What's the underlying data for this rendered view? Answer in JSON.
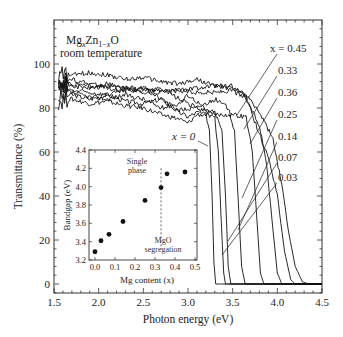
{
  "chart_data": [
    {
      "type": "line",
      "title": "",
      "annotation_title": [
        "MgxZn1-xO",
        "room temperature"
      ],
      "xlabel": "Photon energy (eV)",
      "ylabel": "Transmittance (%)",
      "xlim": [
        1.5,
        4.5
      ],
      "ylim": [
        -5,
        118
      ],
      "xticks": [
        1.5,
        2.0,
        2.5,
        3.0,
        3.5,
        4.0,
        4.5
      ],
      "xtick_labels": [
        "1.5",
        "2.0",
        "2.5",
        "3.0",
        "3.5",
        "4.0",
        "4.5"
      ],
      "yticks": [
        0,
        20,
        40,
        60,
        80,
        100
      ],
      "ytick_labels": [
        "0",
        "20",
        "40",
        "60",
        "80",
        "100"
      ],
      "grid": false,
      "legend": "inline labels on right with leader lines",
      "series": [
        {
          "name": "x = 0",
          "label": "x = 0",
          "edge_eV": 3.27,
          "points": [
            [
              1.55,
              85
            ],
            [
              1.7,
              86
            ],
            [
              1.9,
              84
            ],
            [
              2.1,
              86
            ],
            [
              2.3,
              83
            ],
            [
              2.5,
              82
            ],
            [
              2.7,
              84
            ],
            [
              2.9,
              78
            ],
            [
              3.0,
              76
            ],
            [
              3.1,
              78
            ],
            [
              3.2,
              77
            ],
            [
              3.24,
              70
            ],
            [
              3.27,
              40
            ],
            [
              3.29,
              10
            ],
            [
              3.31,
              0
            ],
            [
              4.5,
              0
            ]
          ]
        },
        {
          "name": "x = 0.03",
          "label": "0.03",
          "edge_eV": 3.37,
          "points": [
            [
              1.55,
              83
            ],
            [
              1.7,
              84
            ],
            [
              1.9,
              82
            ],
            [
              2.1,
              83
            ],
            [
              2.3,
              81
            ],
            [
              2.5,
              80
            ],
            [
              2.7,
              77
            ],
            [
              2.9,
              75
            ],
            [
              3.0,
              73
            ],
            [
              3.1,
              77
            ],
            [
              3.2,
              77
            ],
            [
              3.3,
              75
            ],
            [
              3.34,
              60
            ],
            [
              3.37,
              30
            ],
            [
              3.4,
              5
            ],
            [
              3.42,
              0
            ],
            [
              4.5,
              0
            ]
          ]
        },
        {
          "name": "x = 0.07",
          "label": "0.07",
          "edge_eV": 3.42,
          "points": [
            [
              1.55,
              88
            ],
            [
              1.7,
              87
            ],
            [
              1.9,
              85
            ],
            [
              2.1,
              84
            ],
            [
              2.3,
              86
            ],
            [
              2.5,
              84
            ],
            [
              2.7,
              80
            ],
            [
              2.9,
              82
            ],
            [
              3.0,
              86
            ],
            [
              3.1,
              83
            ],
            [
              3.2,
              79
            ],
            [
              3.3,
              78
            ],
            [
              3.38,
              70
            ],
            [
              3.42,
              40
            ],
            [
              3.45,
              8
            ],
            [
              3.48,
              0
            ],
            [
              4.5,
              0
            ]
          ]
        },
        {
          "name": "x = 0.14",
          "label": "0.14",
          "edge_eV": 3.56,
          "points": [
            [
              1.55,
              90
            ],
            [
              1.7,
              88
            ],
            [
              1.9,
              87
            ],
            [
              2.1,
              86
            ],
            [
              2.3,
              88
            ],
            [
              2.5,
              89
            ],
            [
              2.7,
              84
            ],
            [
              2.9,
              79
            ],
            [
              3.1,
              80
            ],
            [
              3.3,
              84
            ],
            [
              3.45,
              80
            ],
            [
              3.52,
              70
            ],
            [
              3.56,
              40
            ],
            [
              3.6,
              8
            ],
            [
              3.64,
              0
            ],
            [
              4.5,
              0
            ]
          ]
        },
        {
          "name": "x = 0.25",
          "label": "0.25",
          "edge_eV": 3.77,
          "points": [
            [
              1.55,
              92
            ],
            [
              1.7,
              90
            ],
            [
              1.9,
              89
            ],
            [
              2.1,
              91
            ],
            [
              2.3,
              89
            ],
            [
              2.5,
              87
            ],
            [
              2.7,
              89
            ],
            [
              2.9,
              84
            ],
            [
              3.1,
              80
            ],
            [
              3.3,
              77
            ],
            [
              3.5,
              77
            ],
            [
              3.65,
              76
            ],
            [
              3.72,
              60
            ],
            [
              3.77,
              30
            ],
            [
              3.81,
              5
            ],
            [
              3.85,
              0
            ],
            [
              4.5,
              0
            ]
          ]
        },
        {
          "name": "x = 0.36",
          "label": "0.36",
          "edge_eV": 3.97,
          "points": [
            [
              1.55,
              90
            ],
            [
              1.7,
              91
            ],
            [
              1.9,
              90
            ],
            [
              2.1,
              89
            ],
            [
              2.3,
              88
            ],
            [
              2.5,
              88
            ],
            [
              2.7,
              87
            ],
            [
              2.9,
              88
            ],
            [
              3.1,
              87
            ],
            [
              3.3,
              87
            ],
            [
              3.5,
              88
            ],
            [
              3.65,
              84
            ],
            [
              3.8,
              72
            ],
            [
              3.88,
              55
            ],
            [
              3.95,
              25
            ],
            [
              4.0,
              5
            ],
            [
              4.05,
              0
            ],
            [
              4.5,
              0
            ]
          ]
        },
        {
          "name": "x = 0.33",
          "label": "0.33",
          "edge_eV": 4.07,
          "points": [
            [
              1.55,
              92
            ],
            [
              1.7,
              93
            ],
            [
              1.9,
              91
            ],
            [
              2.1,
              90
            ],
            [
              2.3,
              89
            ],
            [
              2.5,
              89
            ],
            [
              2.7,
              88
            ],
            [
              2.9,
              88
            ],
            [
              3.1,
              89
            ],
            [
              3.3,
              90
            ],
            [
              3.5,
              90
            ],
            [
              3.65,
              85
            ],
            [
              3.8,
              68
            ],
            [
              3.9,
              58
            ],
            [
              4.0,
              40
            ],
            [
              4.08,
              15
            ],
            [
              4.15,
              2
            ],
            [
              4.2,
              0
            ],
            [
              4.5,
              0
            ]
          ]
        },
        {
          "name": "x = 0.45",
          "label": "x = 0.45",
          "edge_eV": 4.17,
          "points": [
            [
              1.55,
              95
            ],
            [
              1.7,
              95
            ],
            [
              1.9,
              96
            ],
            [
              2.1,
              95
            ],
            [
              2.3,
              93
            ],
            [
              2.5,
              94
            ],
            [
              2.7,
              92
            ],
            [
              2.9,
              91
            ],
            [
              3.1,
              93
            ],
            [
              3.3,
              90
            ],
            [
              3.5,
              89
            ],
            [
              3.65,
              86
            ],
            [
              3.8,
              78
            ],
            [
              3.95,
              66
            ],
            [
              4.05,
              45
            ],
            [
              4.12,
              25
            ],
            [
              4.2,
              8
            ],
            [
              4.28,
              1
            ],
            [
              4.35,
              0
            ],
            [
              4.5,
              0
            ]
          ]
        }
      ],
      "right_labels": [
        "x = 0.45",
        "0.33",
        "0.36",
        "0.25",
        "0.14",
        "0.07",
        "0.03"
      ],
      "inline_labels": [
        "x = 0"
      ]
    },
    {
      "type": "scatter",
      "title": "inset",
      "xlabel": "Mg content (x)",
      "ylabel": "Bandgap (eV)",
      "xlim": [
        -0.05,
        0.5
      ],
      "ylim": [
        3.2,
        4.4
      ],
      "xticks": [
        0.0,
        0.1,
        0.2,
        0.3,
        0.4,
        0.5
      ],
      "xtick_labels": [
        "0.0",
        "0.1",
        "0.2",
        "0.3",
        "0.4",
        "0.5"
      ],
      "yticks": [
        3.2,
        3.4,
        3.6,
        3.8,
        4.0,
        4.2,
        4.4
      ],
      "ytick_labels": [
        "3.2",
        "3.4",
        "3.6",
        "3.8",
        "4.0",
        "4.2",
        "4.4"
      ],
      "x": [
        0.0,
        0.03,
        0.07,
        0.14,
        0.25,
        0.33,
        0.36,
        0.45
      ],
      "values": [
        3.29,
        3.41,
        3.48,
        3.62,
        3.85,
        3.99,
        4.14,
        4.16
      ],
      "annotations": [
        {
          "text": [
            "Single",
            "phase"
          ],
          "x": 0.2,
          "y": 4.15
        },
        {
          "text": [
            "MgO",
            "segregation"
          ],
          "x": 0.36,
          "y": 3.35
        }
      ],
      "vline": {
        "x": 0.33,
        "style": "dashed",
        "from": 3.32,
        "to": 4.2
      }
    }
  ]
}
